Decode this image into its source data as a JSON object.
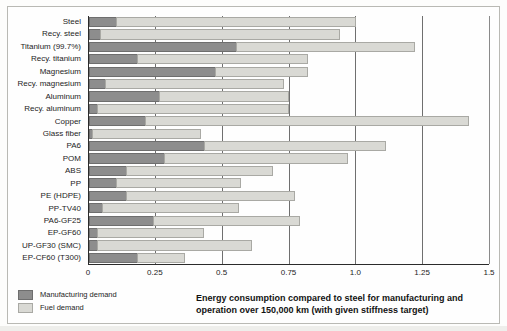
{
  "chart_data": {
    "type": "bar",
    "orientation": "horizontal",
    "stacked": true,
    "title": "",
    "xlabel": "",
    "ylabel": "",
    "xlim": [
      0,
      1.5
    ],
    "xticks": [
      "0",
      "0.25",
      "0.5",
      "0.75",
      "1.0",
      "1.25",
      "1.5"
    ],
    "xtick_values": [
      0,
      0.25,
      0.5,
      0.75,
      1.0,
      1.25,
      1.5
    ],
    "grid": true,
    "grid_axis": "x",
    "legend_position": "below-left",
    "categories": [
      "Steel",
      "Recy. steel",
      "Titanium (99.7%)",
      "Recy. titanium",
      "Magnesium",
      "Recy. magnesium",
      "Aluminum",
      "Recy. aluminum",
      "Copper",
      "Glass fiber",
      "PA6",
      "POM",
      "ABS",
      "PP",
      "PE (HDPE)",
      "PP-TV40",
      "PA6-GF25",
      "EP-GF60",
      "UP-GF30 (SMC)",
      "EP-CF60 (T300)"
    ],
    "series": [
      {
        "name": "Manufacturing demand",
        "color": "#8d8d8d",
        "values": [
          0.1,
          0.04,
          0.55,
          0.18,
          0.47,
          0.06,
          0.26,
          0.03,
          0.21,
          0.01,
          0.43,
          0.28,
          0.14,
          0.1,
          0.14,
          0.05,
          0.24,
          0.03,
          0.03,
          0.18
        ]
      },
      {
        "name": "Fuel demand",
        "color": "#d9d9d4",
        "values": [
          0.9,
          0.9,
          0.67,
          0.64,
          0.35,
          0.67,
          0.49,
          0.72,
          1.21,
          0.41,
          0.68,
          0.69,
          0.55,
          0.47,
          0.63,
          0.51,
          0.55,
          0.4,
          0.58,
          0.18
        ]
      }
    ],
    "totals": [
      1.0,
      0.94,
      1.22,
      0.82,
      0.82,
      0.73,
      0.75,
      0.75,
      1.42,
      0.42,
      1.11,
      0.97,
      0.69,
      0.57,
      0.77,
      0.56,
      0.79,
      0.43,
      0.61,
      0.36
    ]
  },
  "legend": {
    "items": [
      {
        "label": "Manufacturing demand",
        "swatch": "mfg"
      },
      {
        "label": "Fuel demand",
        "swatch": "fuel"
      }
    ]
  },
  "caption": {
    "line1": "Energy consumption compared to steel for manufacturing and",
    "line2": "operation over 150,000 km (with given stiffness target)"
  }
}
